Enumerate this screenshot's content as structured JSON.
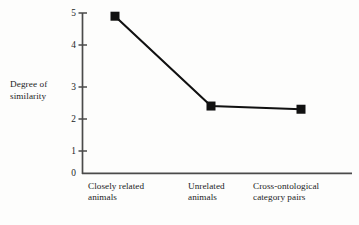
{
  "chart_data": {
    "type": "line",
    "title": "",
    "xlabel": "",
    "ylabel": "Degree of similarity",
    "ylabel_lines": [
      "Degree of",
      "similarity"
    ],
    "categories": [
      "Closely related animals",
      "Unrelated animals",
      "Cross-ontological category pairs"
    ],
    "category_lines": [
      [
        "Closely related",
        "animals"
      ],
      [
        "Unrelated",
        "animals"
      ],
      [
        "Cross-ontological",
        "category pairs"
      ]
    ],
    "values": [
      4.9,
      2.1,
      2.0
    ],
    "ylim": [
      0,
      5
    ],
    "yticks": [
      5,
      4,
      3,
      2,
      1,
      0
    ],
    "ytick_labels": [
      "5",
      "4",
      "3",
      "2",
      "1",
      "0"
    ],
    "grid": false,
    "legend": "none",
    "marker": "square",
    "marker_color": "#111111",
    "line_color": "#111111",
    "axis_color": "#4a4a4a",
    "background": "#fdfdfc"
  }
}
